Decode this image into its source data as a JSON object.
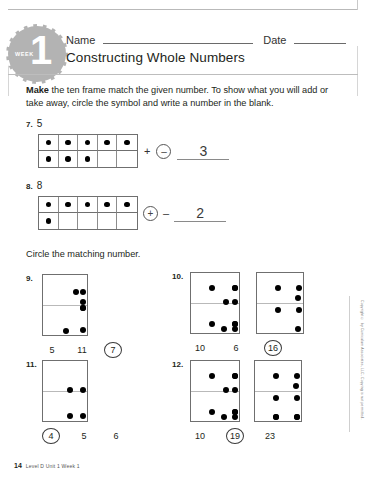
{
  "header": {
    "badge_week_label": "WEEK",
    "badge_number": "1",
    "name_label": "Name",
    "date_label": "Date",
    "title": "Constructing Whole Numbers"
  },
  "instructions": {
    "lead": "Make",
    "rest": " the ten frame match the given number. To show what you will add or take away, circle the symbol and write a number in the blank."
  },
  "section2": {
    "lead": "Circle",
    "rest": " the matching number."
  },
  "tenframe_problems": [
    {
      "number": "7.",
      "given": "5",
      "top_row_dots": 5,
      "bottom_row_dots": 3,
      "circled_symbol": "–",
      "circled_is_first": true,
      "second_symbol": "",
      "answer": "3"
    },
    {
      "number": "8.",
      "given": "8",
      "top_row_dots": 5,
      "bottom_row_dots": 1,
      "circled_symbol": "+",
      "circled_is_first": true,
      "second_symbol": "–",
      "answer": "2"
    }
  ],
  "match_problems": [
    {
      "number": "9.",
      "boxes": [
        {
          "dots": [
            [
              30,
              14
            ],
            [
              62,
              14
            ],
            [
              40,
              30
            ],
            [
              68,
              30
            ],
            [
              68,
              52
            ],
            [
              20,
              74
            ]
          ],
          "extra": [
            [
              48,
              24
            ]
          ],
          "count": 7
        }
      ],
      "choices": [
        "5",
        "11",
        "7"
      ],
      "circled_index": 2
    },
    {
      "number": "10.",
      "boxes": [
        {
          "dots": [
            [
              18,
              12
            ],
            [
              46,
              12
            ],
            [
              74,
              12
            ],
            [
              32,
              26
            ],
            [
              60,
              26
            ],
            [
              18,
              48
            ],
            [
              46,
              48
            ],
            [
              74,
              48
            ],
            [
              30,
              66
            ],
            [
              58,
              66
            ]
          ],
          "count": 10
        },
        {
          "dots": [
            [
              18,
              12
            ],
            [
              60,
              12
            ],
            [
              38,
              22
            ],
            [
              18,
              34
            ],
            [
              60,
              34
            ],
            [
              38,
              58
            ]
          ],
          "count": 6
        }
      ],
      "choices": [
        "10",
        "6",
        "16"
      ],
      "circled_index": 2
    },
    {
      "number": "11.",
      "boxes": [
        {
          "dots": [
            [
              24,
              26
            ],
            [
              58,
              26
            ],
            [
              24,
              52
            ],
            [
              58,
              52
            ]
          ],
          "count": 4
        }
      ],
      "choices": [
        "4",
        "5",
        "6"
      ],
      "circled_index": 0
    },
    {
      "number": "12.",
      "boxes": [
        {
          "dots": [
            [
              18,
              12
            ],
            [
              46,
              12
            ],
            [
              74,
              12
            ],
            [
              32,
              26
            ],
            [
              60,
              26
            ],
            [
              18,
              48
            ],
            [
              46,
              48
            ],
            [
              74,
              48
            ],
            [
              30,
              66
            ],
            [
              58,
              66
            ]
          ],
          "count": 10
        },
        {
          "dots": [
            [
              18,
              12
            ],
            [
              58,
              12
            ],
            [
              38,
              22
            ],
            [
              18,
              34
            ],
            [
              58,
              34
            ],
            [
              18,
              54
            ],
            [
              58,
              54
            ],
            [
              18,
              72
            ],
            [
              58,
              72
            ]
          ],
          "count": 9
        }
      ],
      "choices": [
        "10",
        "19",
        "23"
      ],
      "circled_index": 1
    }
  ],
  "side_copyright": "Copyright © by Curriculum Associates, LLC. Copying is not permitted.",
  "footer": {
    "page_number": "14",
    "text": "Level D Unit 1 Week 1"
  }
}
